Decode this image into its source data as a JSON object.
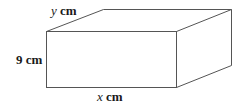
{
  "diagram": {
    "type": "rectangular-prism",
    "stroke_color": "#555555",
    "background": "#ffffff",
    "labels": {
      "depth": {
        "variable": "y",
        "unit": "cm"
      },
      "height": {
        "value": "9",
        "unit": "cm"
      },
      "width": {
        "variable": "x",
        "unit": "cm"
      }
    }
  }
}
